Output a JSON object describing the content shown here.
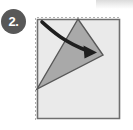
{
  "figure": {
    "step_badge": {
      "label": "2.",
      "shape": "circle",
      "background_color": "#585858",
      "text_color": "#ffffff"
    },
    "canvas": {
      "width": 133,
      "height": 130,
      "background_color": "#ffffff"
    },
    "colors": {
      "paper_fill": "#eaeaea",
      "paper_stroke": "#6f6f6f",
      "flap_fill": "#a9a9a9",
      "flap_stroke": "#585858",
      "fold_guide_stroke": "#b0b0b0",
      "arrow_color": "#1f1f1f",
      "corner_highlight": "#cfcfcf"
    },
    "shapes": {
      "paper_sheet": {
        "name": "square-sheet-of-paper",
        "points": "37,19 120,19 120,119 37,119",
        "fill": "#eaeaea",
        "stroke": "#6f6f6f",
        "stroke_width": 1.6
      },
      "fold_guide": {
        "name": "dashed-fold-guide",
        "points": "37,18 120,18",
        "vertical_points": "36,19 36,119",
        "stroke": "#b0b0b0",
        "stroke_width": 1,
        "dash_pattern": "2,2"
      },
      "folded_flap": {
        "name": "folded-triangular-flap",
        "points": "37,89 78,19 103,55",
        "fill": "#a9a9a9",
        "stroke": "#585858",
        "stroke_width": 1.4
      },
      "fold_arrow": {
        "name": "curved-fold-direction-arrow",
        "path": "M 42,22 C 54,33 68,45 90,52",
        "stroke": "#1f1f1f",
        "stroke_width": 3.4,
        "arrowhead_points": "96,52 84,46 85,58"
      }
    },
    "labels": {
      "caption": "",
      "alt_text": "Step 2: fold the left corner of the square upward along the dashed line"
    }
  }
}
